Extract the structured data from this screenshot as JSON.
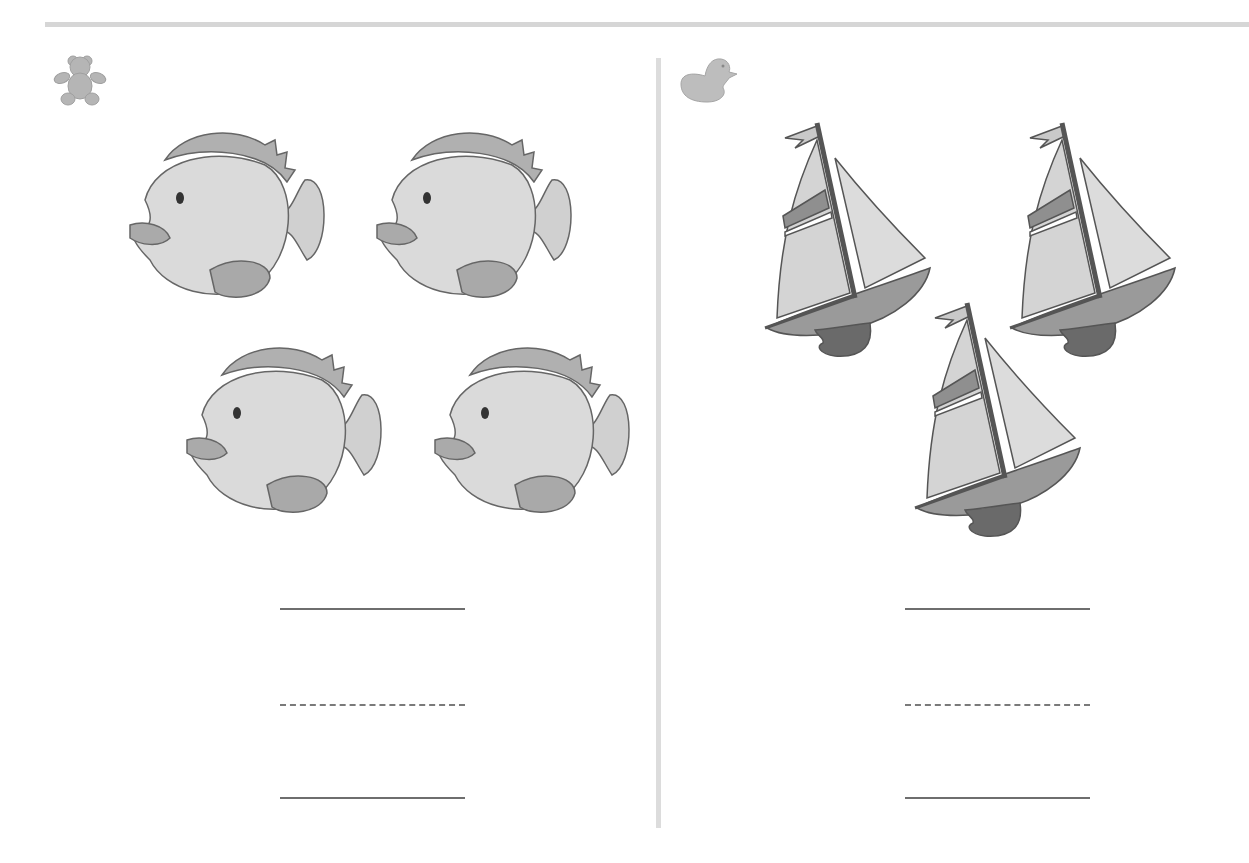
{
  "page": {
    "type": "counting worksheet",
    "colors": {
      "rule": "#d6d6d6",
      "divider": "#dcdcdc",
      "writing_line": "#6e6e6e",
      "fish_body": "#dadada",
      "fish_fin": "#a9a9a9",
      "sail": "#d4d4d4",
      "sail_stripe": "#8f8f8f",
      "hull": "#9a9a9a",
      "keel": "#6a6a6a",
      "icon_fill": "#b5b5b5"
    }
  },
  "left_panel": {
    "corner_icon": "teddy-bear-icon",
    "object": "fish",
    "count": 4,
    "items": [
      {
        "x": 125,
        "y": 80
      },
      {
        "x": 372,
        "y": 80
      },
      {
        "x": 182,
        "y": 295
      },
      {
        "x": 430,
        "y": 295
      }
    ],
    "answer_lines": [
      {
        "style": "solid",
        "x": 280,
        "y": 568,
        "width": 185
      },
      {
        "style": "dashed",
        "x": 280,
        "y": 664,
        "width": 185
      },
      {
        "style": "solid",
        "x": 280,
        "y": 757,
        "width": 185
      }
    ]
  },
  "right_panel": {
    "corner_icon": "duck-icon",
    "object": "sailboat",
    "count": 3,
    "items": [
      {
        "x": 90,
        "y": 78
      },
      {
        "x": 335,
        "y": 78
      },
      {
        "x": 240,
        "y": 258
      }
    ],
    "answer_lines": [
      {
        "style": "solid",
        "x": 240,
        "y": 568,
        "width": 185
      },
      {
        "style": "dashed",
        "x": 240,
        "y": 664,
        "width": 185
      },
      {
        "style": "solid",
        "x": 240,
        "y": 757,
        "width": 185
      }
    ]
  }
}
